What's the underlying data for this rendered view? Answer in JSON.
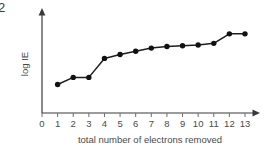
{
  "figure": {
    "number_label": "2"
  },
  "chart_data": {
    "type": "line",
    "title": "",
    "xlabel": "total number of electrons removed",
    "ylabel": "log IE",
    "x": [
      1,
      2,
      3,
      4,
      5,
      6,
      7,
      8,
      9,
      10,
      11,
      12,
      13
    ],
    "values": [
      0.36,
      0.45,
      0.45,
      0.69,
      0.74,
      0.78,
      0.82,
      0.84,
      0.85,
      0.86,
      0.88,
      1.0,
      1.0
    ],
    "xticks": [
      "0",
      "1",
      "2",
      "3",
      "4",
      "5",
      "6",
      "7",
      "8",
      "9",
      "10",
      "11",
      "12",
      "13"
    ],
    "xlim": [
      0,
      13
    ],
    "ylim": [
      0,
      1.15
    ],
    "yticks": [],
    "grid": false,
    "legend": false,
    "marker": "filled-circle",
    "series_color": "#111111",
    "axis_color": "#3a3a3a"
  }
}
